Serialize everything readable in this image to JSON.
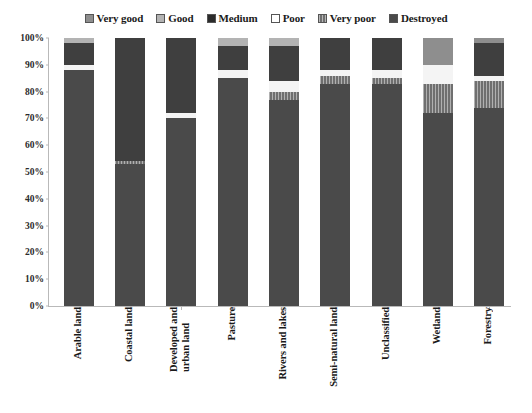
{
  "chart_data": {
    "type": "bar",
    "subtype": "100% stacked column",
    "title": "",
    "xlabel": "",
    "ylabel": "",
    "ylim": [
      0,
      100
    ],
    "ytick_labels": [
      "100%",
      "90%",
      "80%",
      "70%",
      "60%",
      "50%",
      "40%",
      "30%",
      "20%",
      "10%",
      "0%"
    ],
    "ytick_values": [
      100,
      90,
      80,
      70,
      60,
      50,
      40,
      30,
      20,
      10,
      0
    ],
    "grid": false,
    "legend_position": "top",
    "categories": [
      "Arable land",
      "Coastal land",
      "Developed and\nurban land",
      "Pasture",
      "Rivers and lakes",
      "Semi-natural land",
      "Unclassified",
      "Wetland",
      "Forestry"
    ],
    "series": [
      {
        "name": "Very good",
        "color": "#8e8e8e",
        "values": [
          0,
          0,
          0,
          0,
          0,
          0,
          0,
          10,
          2
        ]
      },
      {
        "name": "Good",
        "color": "#b3b3b3",
        "values": [
          2,
          0,
          0,
          3,
          3,
          0,
          0,
          0,
          0
        ]
      },
      {
        "name": "Medium",
        "color": "#3f3f3f",
        "values": [
          8,
          46,
          28,
          9,
          13,
          12,
          12,
          0,
          12
        ]
      },
      {
        "name": "Poor",
        "color": "#f4f4f4",
        "values": [
          2,
          0,
          2,
          3,
          4,
          2,
          3,
          7,
          2
        ]
      },
      {
        "name": "Very poor",
        "color": "#6f6f6f",
        "values": [
          0,
          1,
          0,
          0,
          3,
          3,
          2,
          11,
          10
        ]
      },
      {
        "name": "Destroyed",
        "color": "#4a4a4a",
        "values": [
          88,
          53,
          70,
          85,
          77,
          83,
          83,
          72,
          74
        ]
      }
    ]
  }
}
